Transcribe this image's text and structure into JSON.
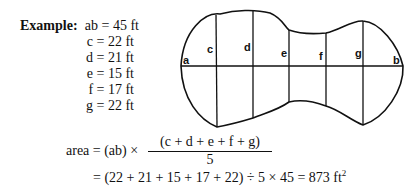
{
  "example": {
    "title": "Example:",
    "values": [
      {
        "label": "ab = 45 ft"
      },
      {
        "label": "c = 22 ft"
      },
      {
        "label": "d = 21 ft"
      },
      {
        "label": "e = 15 ft"
      },
      {
        "label": "f = 17 ft"
      },
      {
        "label": "g = 22 ft"
      }
    ]
  },
  "diagram": {
    "labels": {
      "a": "a",
      "b": "b",
      "c": "c",
      "d": "d",
      "e": "e",
      "f": "f",
      "g": "g"
    }
  },
  "formula": {
    "lhs": "area = (ab) ×",
    "numerator": "(c + d + e + f + g)",
    "denominator": "5",
    "line2": "= (22 + 21 + 15 + 17 + 22) ÷ 5 × 45 = 873 ft",
    "unit_exp": "2"
  }
}
